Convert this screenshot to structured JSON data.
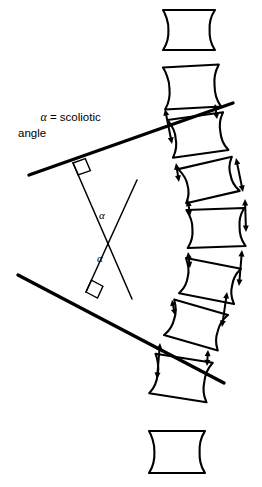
{
  "figure": {
    "background_color": "#ffffff",
    "ink_color": "#000000"
  },
  "caption": {
    "alpha_symbol": "α",
    "line1_rest": " = scoliotic",
    "line2": "angle",
    "full_text": "α = scoliotic angle"
  },
  "angle_labels": [
    {
      "id": "alpha-upper",
      "text": "α",
      "x": 99,
      "y": 219
    },
    {
      "id": "alpha-lower",
      "text": "α",
      "x": 97,
      "y": 262
    }
  ],
  "cobb_lines": [
    {
      "id": "upper-endplate-tangent",
      "x1": 29,
      "y1": 175,
      "x2": 233,
      "y2": 103
    },
    {
      "id": "lower-endplate-tangent",
      "x1": 18,
      "y1": 275,
      "x2": 224,
      "y2": 383
    }
  ],
  "perpendicular_lines": [
    {
      "id": "perpendicular-from-upper-line",
      "x1": 73,
      "y1": 163,
      "x2": 132,
      "y2": 299
    },
    {
      "id": "perpendicular-from-lower-line",
      "x1": 86,
      "y1": 292,
      "x2": 137,
      "y2": 180
    }
  ],
  "right_angle_markers": [
    {
      "id": "right-angle-upper",
      "x": 73,
      "y": 163
    },
    {
      "id": "right-angle-lower",
      "x": 86,
      "y": 292
    }
  ],
  "intersection_point": {
    "x": 113,
    "y": 237
  },
  "vertebrae": [
    {
      "id": "vertebra-1",
      "label": "neutral-top",
      "cx": 189,
      "cy": 30,
      "w": 52,
      "h": 40,
      "rotation": 0,
      "waist": 6
    },
    {
      "id": "vertebra-2",
      "label": "upper-end-vertebra",
      "cx": 192,
      "cy": 87,
      "w": 56,
      "h": 42,
      "rotation": -3,
      "waist": 6
    },
    {
      "id": "vertebra-3",
      "label": "wedged-3",
      "cx": 198,
      "cy": 135,
      "w": 56,
      "h": 38,
      "rotation": -8,
      "waist": 6
    },
    {
      "id": "vertebra-4",
      "label": "wedged-4",
      "cx": 209,
      "cy": 180,
      "w": 55,
      "h": 35,
      "rotation": -13,
      "waist": 6
    },
    {
      "id": "vertebra-5",
      "label": "apex-vertebra",
      "cx": 216,
      "cy": 228,
      "w": 58,
      "h": 38,
      "rotation": -2,
      "waist": 6
    },
    {
      "id": "vertebra-6",
      "label": "wedged-6",
      "cx": 210,
      "cy": 281,
      "w": 56,
      "h": 36,
      "rotation": 11,
      "waist": 6
    },
    {
      "id": "vertebra-7",
      "label": "wedged-7",
      "cx": 196,
      "cy": 325,
      "w": 56,
      "h": 37,
      "rotation": 16,
      "waist": 6
    },
    {
      "id": "vertebra-8",
      "label": "lower-end-vertebra",
      "cx": 181,
      "cy": 378,
      "w": 58,
      "h": 40,
      "rotation": 9,
      "waist": 6
    },
    {
      "id": "vertebra-9",
      "label": "neutral-bottom",
      "cx": 177,
      "cy": 452,
      "w": 56,
      "h": 42,
      "rotation": 0,
      "waist": 6
    }
  ],
  "disc_space_arrows": [
    {
      "id": "disc-arrow-convex-1",
      "side": "convex-left",
      "length": "long",
      "x1": 165,
      "y1": 109,
      "x2": 172,
      "y2": 144
    },
    {
      "id": "disc-arrow-concave-1",
      "side": "concave-right",
      "length": "short",
      "x1": 215,
      "y1": 104,
      "x2": 217,
      "y2": 119
    },
    {
      "id": "disc-arrow-convex-2",
      "side": "convex-left",
      "length": "short",
      "x1": 176,
      "y1": 163,
      "x2": 179,
      "y2": 182
    },
    {
      "id": "disc-arrow-concave-2",
      "side": "concave-right",
      "length": "long",
      "x1": 236,
      "y1": 158,
      "x2": 243,
      "y2": 192
    },
    {
      "id": "disc-arrow-convex-3",
      "side": "convex-left",
      "length": "short",
      "x1": 188,
      "y1": 200,
      "x2": 190,
      "y2": 216
    },
    {
      "id": "disc-arrow-concave-3",
      "side": "concave-right",
      "length": "long",
      "x1": 245,
      "y1": 199,
      "x2": 246,
      "y2": 232
    },
    {
      "id": "disc-arrow-convex-4",
      "side": "convex-left",
      "length": "short",
      "x1": 188,
      "y1": 252,
      "x2": 190,
      "y2": 268
    },
    {
      "id": "disc-arrow-concave-4",
      "side": "concave-right",
      "length": "long",
      "x1": 242,
      "y1": 250,
      "x2": 239,
      "y2": 286
    },
    {
      "id": "disc-arrow-convex-5",
      "side": "convex-left",
      "length": "short",
      "x1": 172,
      "y1": 300,
      "x2": 175,
      "y2": 315
    },
    {
      "id": "disc-arrow-concave-5",
      "side": "concave-right",
      "length": "long",
      "x1": 227,
      "y1": 292,
      "x2": 222,
      "y2": 327
    },
    {
      "id": "disc-arrow-convex-6",
      "side": "convex-left",
      "length": "long",
      "x1": 160,
      "y1": 343,
      "x2": 157,
      "y2": 379
    },
    {
      "id": "disc-arrow-concave-6",
      "side": "concave-right",
      "length": "short",
      "x1": 208,
      "y1": 350,
      "x2": 207,
      "y2": 366
    }
  ]
}
